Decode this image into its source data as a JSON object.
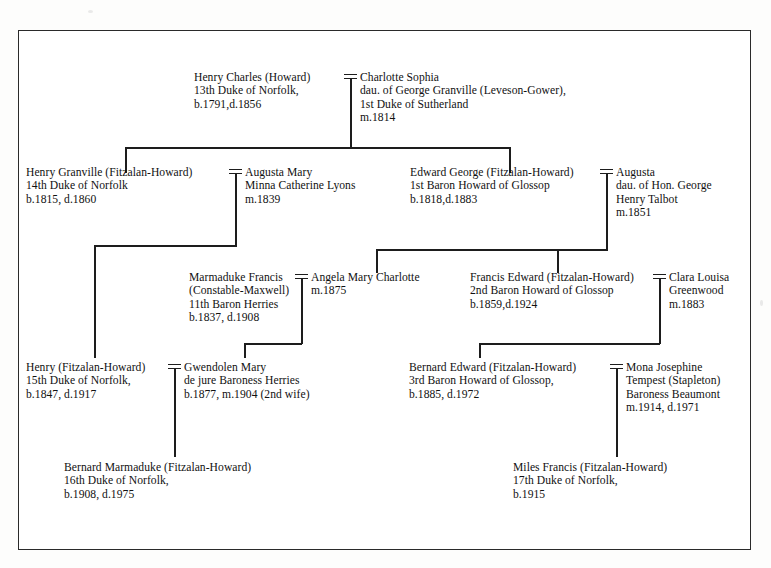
{
  "document": {
    "title": "Howard / Fitzalan-Howard Family Tree",
    "frame_color": "#2a2a2a",
    "line_color": "#1d1d1d",
    "background": "#ffffff"
  },
  "people": {
    "henry_charles": {
      "name": "Henry Charles (Howard)",
      "line2": "13th Duke of Norfolk,",
      "line3": "b.1791,d.1856"
    },
    "charlotte_sophia": {
      "name": "Charlotte Sophia",
      "line2": "dau. of George Granville (Leveson-Gower),",
      "line3": "1st Duke of Sutherland",
      "line4": "m.1814"
    },
    "henry_granville": {
      "name": "Henry Granville (Fitzalan-Howard)",
      "line2": "14th Duke of Norfolk",
      "line3": "b.1815, d.1860"
    },
    "augusta_mary": {
      "name": "Augusta Mary",
      "line2": "Minna Catherine Lyons",
      "line3": "m.1839"
    },
    "edward_george": {
      "name": "Edward George (Fitzalan-Howard)",
      "line2": "1st Baron Howard of Glossop",
      "line3": "b.1818,d.1883"
    },
    "augusta_talbot": {
      "name": "Augusta",
      "line2": "dau. of Hon. George",
      "line3": "Henry Talbot",
      "line4": "m.1851"
    },
    "marmaduke_francis": {
      "name": "Marmaduke Francis",
      "line2": "(Constable-Maxwell)",
      "line3": "11th Baron Herries",
      "line4": "b.1837, d.1908"
    },
    "angela_mary": {
      "name": "Angela Mary Charlotte",
      "line2": "m.1875"
    },
    "francis_edward": {
      "name": "Francis Edward (Fitzalan-Howard)",
      "line2": "2nd Baron Howard of Glossop",
      "line3": "b.1859,d.1924"
    },
    "clara_louisa": {
      "name": "Clara Louisa",
      "line2": "Greenwood",
      "line3": "m.1883"
    },
    "henry_15th": {
      "name": "Henry (Fitzalan-Howard)",
      "line2": "15th Duke of Norfolk,",
      "line3": "b.1847, d.1917"
    },
    "gwendolen_mary": {
      "name": "Gwendolen Mary",
      "line2": "de jure Baroness Herries",
      "line3": "b.1877, m.1904 (2nd wife)"
    },
    "bernard_edward": {
      "name": "Bernard Edward (Fitzalan-Howard)",
      "line2": "3rd Baron Howard of Glossop,",
      "line3": "b.1885, d.1972"
    },
    "mona_josephine": {
      "name": "Mona Josephine",
      "line2": "Tempest (Stapleton)",
      "line3": "Baroness Beaumont",
      "line4": "m.1914, d.1971"
    },
    "bernard_marmaduke": {
      "name": "Bernard Marmaduke (Fitzalan-Howard)",
      "line2": "16th Duke of Norfolk,",
      "line3": "b.1908, d.1975"
    },
    "miles_francis": {
      "name": "Miles Francis (Fitzalan-Howard)",
      "line2": "17th Duke of Norfolk,",
      "line3": "b.1915"
    }
  }
}
